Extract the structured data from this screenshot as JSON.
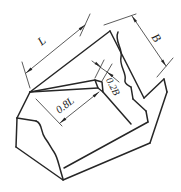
{
  "figure": {
    "dim_labels": {
      "length": "L",
      "width": "B",
      "wedge_length": "0.8L",
      "wedge_width": "0.2B"
    },
    "colors": {
      "line": "#262626",
      "background": "#ffffff"
    }
  }
}
